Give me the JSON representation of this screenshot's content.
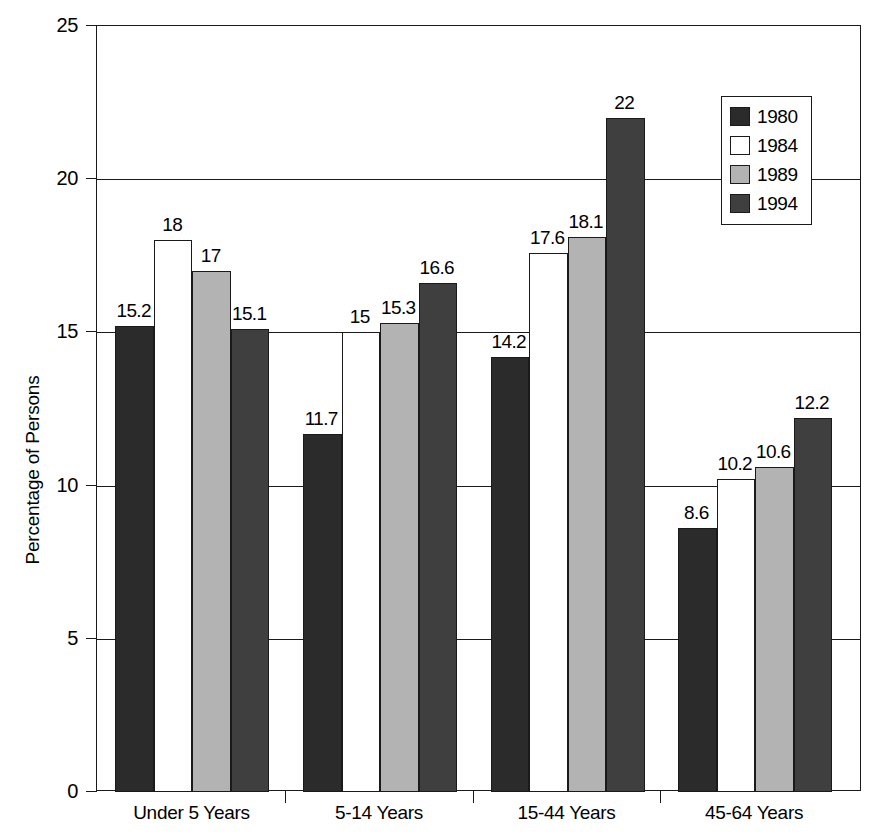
{
  "chart_data": {
    "type": "bar",
    "title": "",
    "subtitle": "",
    "xlabel": "",
    "ylabel": "Percentage of Persons",
    "ylim": [
      0,
      25
    ],
    "yticks": [
      0,
      5,
      10,
      15,
      20,
      25
    ],
    "ytick_labels": [
      "0",
      "5",
      "10",
      "15",
      "20",
      "25"
    ],
    "grid": true,
    "grid_axis": "y",
    "legend_position": "top-right",
    "categories": [
      "Under 5 Years",
      "5-14 Years",
      "15-44 Years",
      "45-64 Years"
    ],
    "series": [
      {
        "name": "1980",
        "color": "#2b2b2b",
        "values": [
          15.2,
          11.7,
          14.2,
          8.6
        ],
        "value_labels": [
          "15.2",
          "11.7",
          "14.2",
          "8.6"
        ]
      },
      {
        "name": "1984",
        "color": "#ffffff",
        "values": [
          18,
          15,
          17.6,
          10.2
        ],
        "value_labels": [
          "18",
          "15",
          "17.6",
          "10.2"
        ]
      },
      {
        "name": "1989",
        "color": "#b3b3b3",
        "values": [
          17,
          15.3,
          18.1,
          10.6
        ],
        "value_labels": [
          "17",
          "15.3",
          "18.1",
          "10.6"
        ]
      },
      {
        "name": "1994",
        "color": "#3f3f3f",
        "values": [
          15.1,
          16.6,
          22,
          12.2
        ],
        "value_labels": [
          "15.1",
          "16.6",
          "22",
          "12.2"
        ]
      }
    ]
  },
  "legend": {
    "entries": [
      {
        "label": "1980",
        "swatch": "#2b2b2b"
      },
      {
        "label": "1984",
        "swatch": "#ffffff"
      },
      {
        "label": "1989",
        "swatch": "#b3b3b3"
      },
      {
        "label": "1994",
        "swatch": "#3f3f3f"
      }
    ]
  },
  "axes": {
    "y_title": "Percentage of Persons",
    "y_labels": [
      "25",
      "20",
      "15",
      "10",
      "5",
      "0"
    ],
    "x_labels": [
      "Under 5 Years",
      "5-14 Years",
      "15-44 Years",
      "45-64 Years"
    ]
  }
}
